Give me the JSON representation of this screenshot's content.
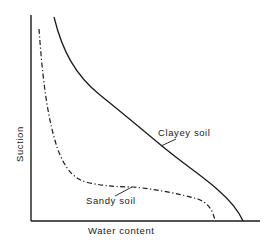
{
  "figure": {
    "type": "soil-water characteristic curve diagram",
    "axes": {
      "y_label": "Suction",
      "x_label": "Water content"
    },
    "curves": [
      {
        "name": "clayey",
        "label": "Clayey soil",
        "line_style": "solid"
      },
      {
        "name": "sandy",
        "label": "Sandy soil",
        "line_style": "dash-dot"
      }
    ],
    "colors": {
      "line": "#1a1a1a",
      "background": "#ffffff"
    }
  }
}
